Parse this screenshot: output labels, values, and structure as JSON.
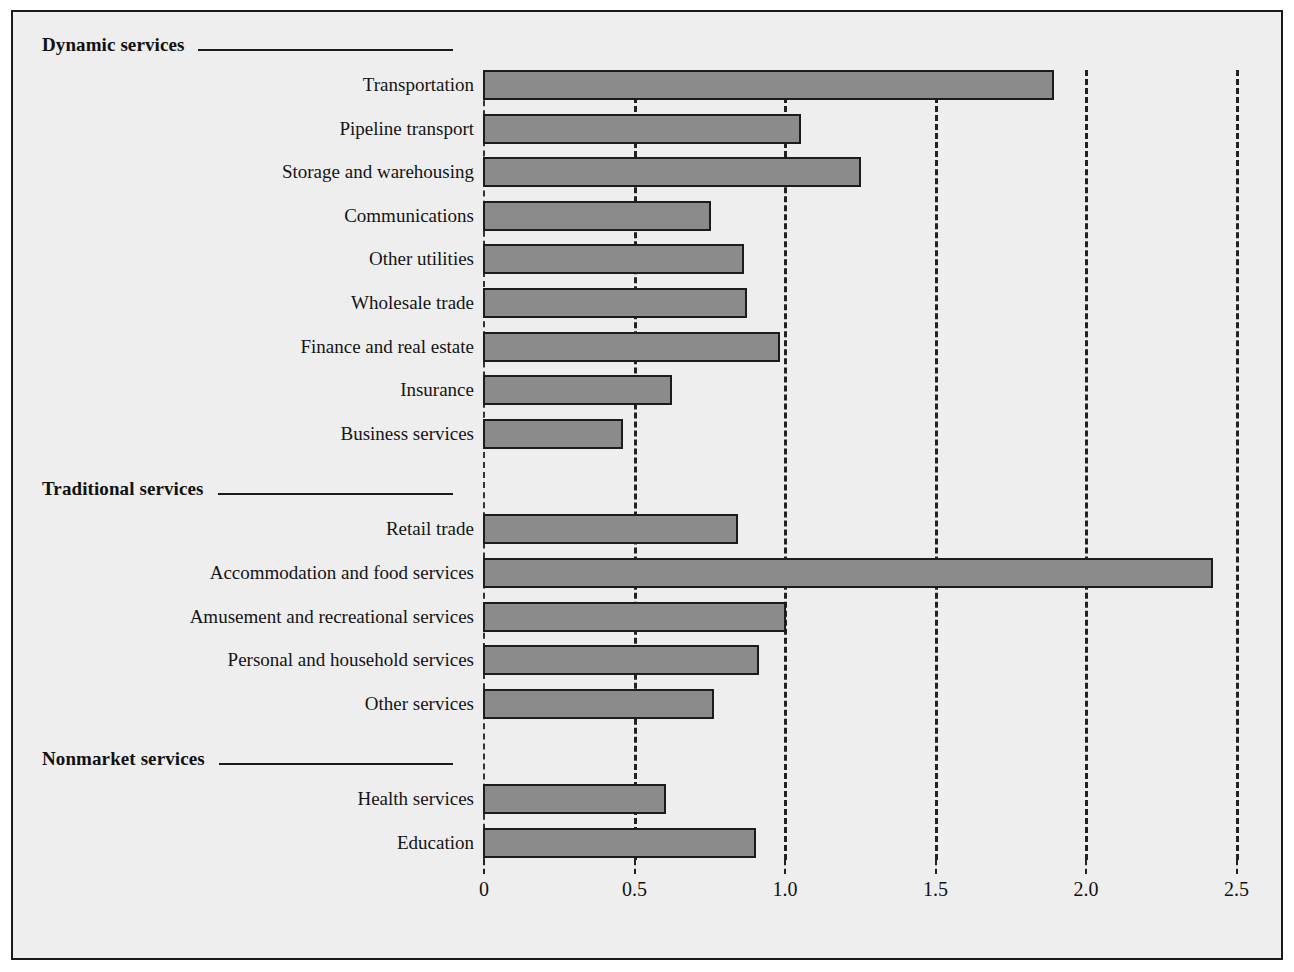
{
  "chart_data": {
    "type": "bar",
    "orientation": "horizontal",
    "title": "",
    "subtitle": "",
    "xlabel": "",
    "ylabel": "",
    "xlim": [
      0,
      2.6
    ],
    "xticks": [
      0,
      0.5,
      1.0,
      1.5,
      2.0,
      2.5
    ],
    "xtick_labels": [
      "0",
      "0.5",
      "1.0",
      "1.5",
      "2.0",
      "2.5"
    ],
    "grid": true,
    "grid_style": "dashed-vertical",
    "legend": "none",
    "groups": [
      {
        "name": "Dynamic services",
        "categories": [
          "Transportation",
          "Pipeline transport",
          "Storage and warehousing",
          "Communications",
          "Other utilities",
          "Wholesale trade",
          "Finance and real estate",
          "Insurance",
          "Business services"
        ],
        "values": [
          1.89,
          1.05,
          1.25,
          0.75,
          0.86,
          0.87,
          0.98,
          0.62,
          0.46
        ]
      },
      {
        "name": "Traditional services",
        "categories": [
          "Retail trade",
          "Accommodation and food services",
          "Amusement and recreational services",
          "Personal and household services",
          "Other services"
        ],
        "values": [
          0.84,
          2.42,
          1.0,
          0.91,
          0.76
        ]
      },
      {
        "name": "Nonmarket services",
        "categories": [
          "Health services",
          "Education"
        ],
        "values": [
          0.6,
          0.9
        ]
      }
    ]
  },
  "style": {
    "panel_background": "#eeeeee",
    "panel_border": "#1a1a1a",
    "bar_fill": "#8b8b8b",
    "bar_stroke": "#1c1c1c",
    "grid_color": "#222222",
    "text_color": "#111111"
  }
}
